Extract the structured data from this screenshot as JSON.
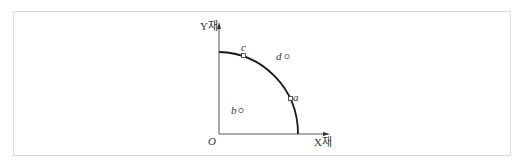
{
  "diagram": {
    "type": "production-possibility-frontier",
    "axes": {
      "y_label": "Y재",
      "x_label": "X재",
      "origin_label": "O"
    },
    "points": [
      {
        "id": "a",
        "label": "a",
        "position": "on-curve"
      },
      {
        "id": "b",
        "label": "b",
        "position": "inside"
      },
      {
        "id": "c",
        "label": "c",
        "position": "on-curve"
      },
      {
        "id": "d",
        "label": "d",
        "position": "outside"
      }
    ],
    "colors": {
      "line": "#222222",
      "frame": "#dcdcdc",
      "text": "#333333"
    }
  }
}
